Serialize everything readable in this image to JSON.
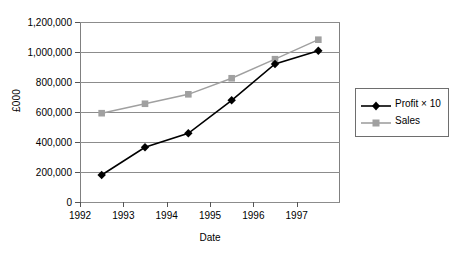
{
  "chart_data": {
    "type": "line",
    "title": "",
    "subtitle": "",
    "xlabel": "Date",
    "ylabel": "£000",
    "x": [
      1992.5,
      1993.5,
      1994.5,
      1995.5,
      1996.5,
      1997.5
    ],
    "xlim": [
      1992,
      1998
    ],
    "ylim": [
      0,
      1200000
    ],
    "grid": "horizontal",
    "legend_position": "right",
    "xticks": [
      1992,
      1993,
      1994,
      1995,
      1996,
      1997
    ],
    "xtick_labels": [
      "1992",
      "1993",
      "1994",
      "1995",
      "1996",
      "1997"
    ],
    "yticks": [
      0,
      200000,
      400000,
      600000,
      800000,
      1000000,
      1200000
    ],
    "ytick_labels": [
      "0",
      "200,000",
      "400,000",
      "600,000",
      "800,000",
      "1,000,000",
      "1,200,000"
    ],
    "series": [
      {
        "name": "Profit × 10",
        "color": "#000000",
        "marker": "diamond",
        "values": [
          180000,
          365000,
          458000,
          678000,
          920000,
          1008000
        ]
      },
      {
        "name": "Sales",
        "color": "#a0a0a0",
        "marker": "square",
        "values": [
          592000,
          655000,
          718000,
          825000,
          952000,
          1082000
        ]
      }
    ]
  },
  "legend": {
    "items": [
      {
        "label": "Profit × 10"
      },
      {
        "label": "Sales"
      }
    ]
  },
  "colors": {
    "profit": "#000000",
    "sales": "#a0a0a0",
    "grid": "#8c8c8c",
    "frame": "#808080",
    "legend_border": "#6e6e6e",
    "background": "#ffffff"
  }
}
